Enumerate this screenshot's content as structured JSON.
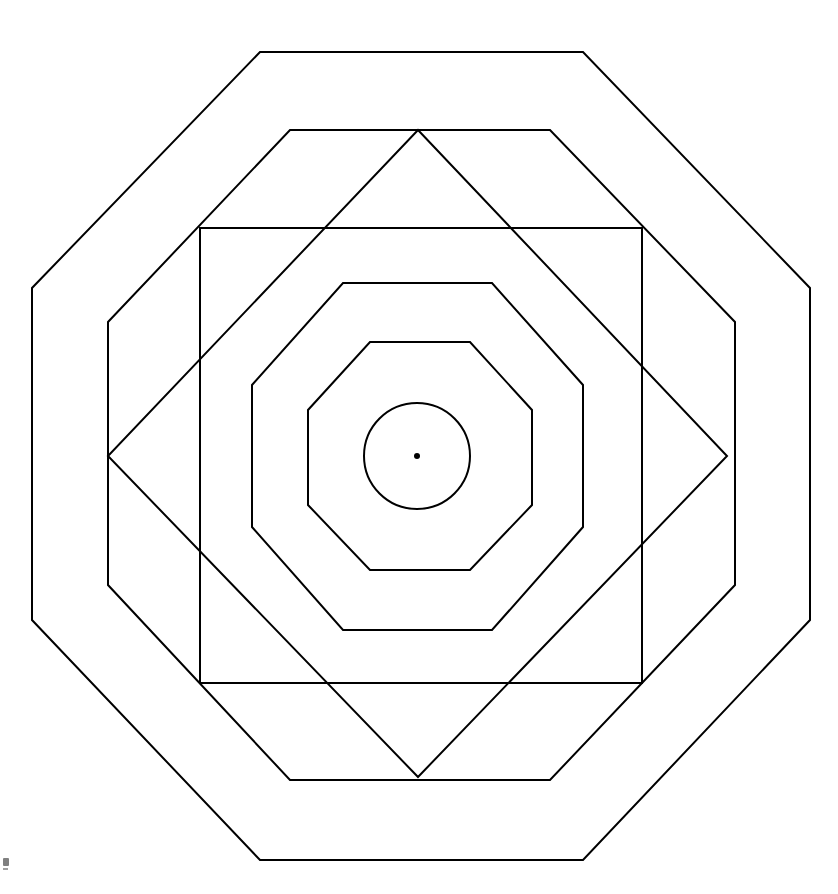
{
  "canvas": {
    "width": 838,
    "height": 894,
    "background_color": "#ffffff",
    "title": "Concentric nested polygons figure"
  },
  "style": {
    "stroke_color": "#000000",
    "fill": "none",
    "stroke_width": 2,
    "thin_stroke_width": 1.6
  },
  "geometry": {
    "center": {
      "x": 417,
      "y": 456
    },
    "center_dot_radius": 3
  },
  "shapes": [
    {
      "id": "outer-octagon",
      "name": "outer-octagon",
      "type": "octagon",
      "order": 1,
      "stroke_width": 2,
      "bounds": {
        "left": 32,
        "top": 52,
        "right": 810,
        "bottom": 860
      },
      "points": "260,52 583,52 810,288 810,620 583,860 260,860 32,620 32,288"
    },
    {
      "id": "second-octagon",
      "name": "second-octagon",
      "type": "octagon",
      "order": 2,
      "stroke_width": 2,
      "bounds": {
        "left": 108,
        "top": 130,
        "right": 735,
        "bottom": 780
      },
      "points": "290,130 550,130 735,322 735,585 550,780 290,780 108,585 108,322"
    },
    {
      "id": "axis-aligned-square",
      "name": "axis-aligned-square",
      "type": "square",
      "order": 3,
      "stroke_width": 2,
      "bounds": {
        "left": 200,
        "top": 228,
        "right": 642,
        "bottom": 683
      },
      "points": "200,228 642,228 642,683 200,683"
    },
    {
      "id": "rotated-square-diamond",
      "name": "rotated-square-diamond",
      "type": "diamond",
      "order": 4,
      "stroke_width": 2,
      "rotation_degrees": 45,
      "vertices": {
        "top": {
          "x": 418,
          "y": 130
        },
        "right": {
          "x": 727,
          "y": 456
        },
        "bottom": {
          "x": 418,
          "y": 777
        },
        "left": {
          "x": 108,
          "y": 456
        }
      },
      "points": "418,130 727,456 418,777 108,456"
    },
    {
      "id": "third-octagon",
      "name": "third-octagon",
      "type": "octagon",
      "order": 5,
      "stroke_width": 2,
      "bounds": {
        "left": 252,
        "top": 283,
        "right": 583,
        "bottom": 630
      },
      "points": "343,283 492,283 583,385 583,527 492,630 343,630 252,527 252,385"
    },
    {
      "id": "fourth-octagon",
      "name": "fourth-octagon",
      "type": "octagon",
      "order": 6,
      "stroke_width": 2,
      "bounds": {
        "left": 308,
        "top": 342,
        "right": 532,
        "bottom": 570
      },
      "points": "370,342 470,342 532,410 532,505 470,570 370,570 308,505 308,410"
    },
    {
      "id": "inner-circle",
      "name": "inner-circle",
      "type": "circle",
      "order": 7,
      "stroke_width": 2,
      "center": {
        "x": 417,
        "y": 456
      },
      "radius": 53
    },
    {
      "id": "center-dot",
      "name": "center-dot",
      "type": "dot",
      "order": 8,
      "center": {
        "x": 417,
        "y": 456
      },
      "radius": 3,
      "filled": true
    }
  ],
  "corner_artifact": {
    "name": "corner-watermark",
    "position": {
      "x": 2,
      "y": 858
    },
    "description": "faint small mark at bottom-left corner"
  }
}
